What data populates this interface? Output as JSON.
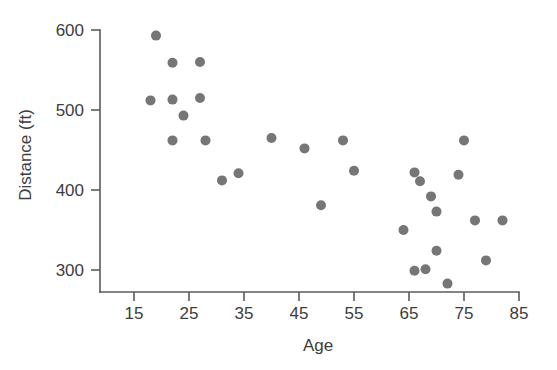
{
  "chart_data": {
    "type": "scatter",
    "title": "",
    "xlabel": "Age",
    "ylabel": "Distance (ft)",
    "xlim": [
      10,
      88
    ],
    "ylim": [
      275,
      610
    ],
    "grid": false,
    "legend": "none",
    "xticks": [
      15,
      25,
      35,
      45,
      55,
      65,
      75,
      85
    ],
    "yticks": [
      300,
      400,
      500,
      600
    ],
    "xticklabels": [
      "15",
      "25",
      "35",
      "45",
      "55",
      "65",
      "75",
      "85"
    ],
    "yticklabels": [
      "300",
      "400",
      "500",
      "600"
    ],
    "marker": "circle",
    "marker_color": "#767676",
    "marker_size": 9,
    "series": [
      {
        "name": "Golf drive distance by age",
        "points": [
          [
            19,
            593
          ],
          [
            18,
            512
          ],
          [
            22,
            559
          ],
          [
            22,
            513
          ],
          [
            24,
            493
          ],
          [
            22,
            462
          ],
          [
            27,
            560
          ],
          [
            27,
            515
          ],
          [
            28,
            462
          ],
          [
            31,
            412
          ],
          [
            34,
            421
          ],
          [
            40,
            465
          ],
          [
            46,
            452
          ],
          [
            49,
            381
          ],
          [
            53,
            462
          ],
          [
            55,
            424
          ],
          [
            64,
            350
          ],
          [
            66,
            422
          ],
          [
            67,
            411
          ],
          [
            66,
            299
          ],
          [
            68,
            301
          ],
          [
            69,
            392
          ],
          [
            70,
            373
          ],
          [
            70,
            324
          ],
          [
            72,
            283
          ],
          [
            74,
            419
          ],
          [
            75,
            462
          ],
          [
            77,
            362
          ],
          [
            79,
            312
          ],
          [
            82,
            362
          ]
        ]
      }
    ]
  },
  "axes": {
    "x_title": "Age",
    "y_title": "Distance (ft)"
  }
}
